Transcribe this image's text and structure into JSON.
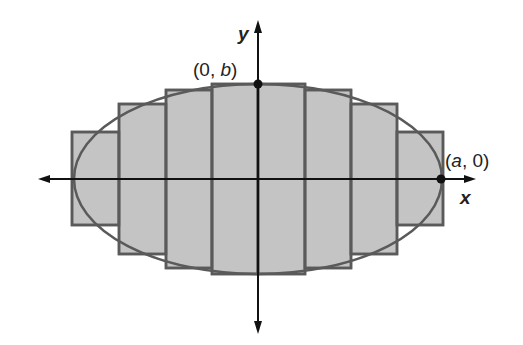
{
  "diagram": {
    "axes": {
      "x_label": "x",
      "y_label": "y"
    },
    "points": [
      {
        "name": "top-vertex",
        "label_prefix": "(0, ",
        "label_var": "b",
        "label_suffix": ")"
      },
      {
        "name": "right-vertex",
        "label_prefix": "(",
        "label_var": "a",
        "label_suffix": ", 0)"
      }
    ],
    "rectangles_count": 8,
    "colors": {
      "fill": "#c4c4c4",
      "stroke": "#555555",
      "axis": "#111111",
      "background": "#ffffff"
    }
  }
}
